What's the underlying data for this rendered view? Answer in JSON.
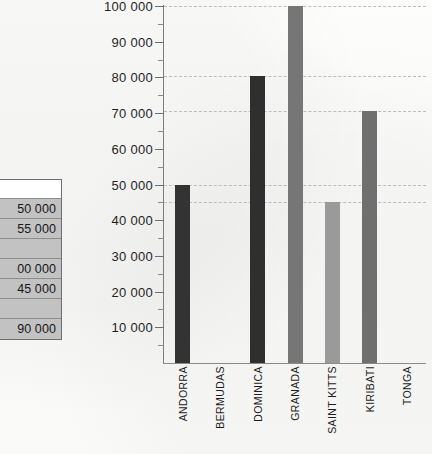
{
  "table_fragment": {
    "name": "cropped-data-table",
    "header_label": "tes",
    "rows": [
      {
        "value": "50 000"
      },
      {
        "value": "55 000"
      },
      {
        "value": ""
      },
      {
        "value": "00 000"
      },
      {
        "value": "45 000"
      },
      {
        "value": ""
      },
      {
        "value": "90 000"
      }
    ]
  },
  "chart_data": {
    "type": "bar",
    "title": "",
    "subtitle": "",
    "xlabel": "",
    "ylabel": "",
    "categories": [
      "ANDORRA",
      "BERMUDAS",
      "DOMINICA",
      "GRANADA",
      "SAINT KITTS",
      "KIRIBATI",
      "TONGA"
    ],
    "values": [
      50000,
      0,
      80500,
      100000,
      45000,
      70500,
      0
    ],
    "series": [
      {
        "name": "Population",
        "values": [
          50000,
          0,
          80500,
          100000,
          45000,
          70500,
          0
        ]
      }
    ],
    "bar_colors": [
      "#333333",
      "#333333",
      "#2f2f2f",
      "#767676",
      "#9a9a9a",
      "#6f6f6f",
      "#767676"
    ],
    "ylim": [
      0,
      100000
    ],
    "ytick_values": [
      10000,
      20000,
      30000,
      40000,
      50000,
      60000,
      70000,
      80000,
      90000,
      100000
    ],
    "ytick_labels": [
      "10 000",
      "20 000",
      "30 000",
      "40 000",
      "50 000",
      "60 000",
      "70 000",
      "80 000",
      "90 000",
      "100 000"
    ],
    "minor_tick_step": 5000,
    "gridlines": [
      45000,
      50000,
      70500,
      80500,
      100000
    ],
    "grid": true,
    "legend": "none",
    "legend_position": "none",
    "annotations": []
  },
  "colors": {
    "axis": "#7d7d7d",
    "gridline": "#bdbdbd",
    "text": "#1b1b1b",
    "table_row_fill": "#c2c2c2",
    "table_border": "#6e6e6e",
    "background": "#fbfbfa"
  }
}
